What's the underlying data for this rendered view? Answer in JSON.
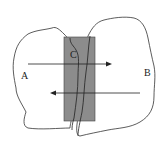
{
  "diagram": {
    "labels": {
      "a": "A",
      "b": "B",
      "c": "C"
    },
    "colors": {
      "outline": "#333333",
      "overlap_fill": "#8c8c8c",
      "arrow": "#222222"
    },
    "arrows": [
      {
        "from": "A",
        "to": "B",
        "direction": "right"
      },
      {
        "from": "B",
        "to": "A",
        "direction": "left"
      }
    ]
  }
}
